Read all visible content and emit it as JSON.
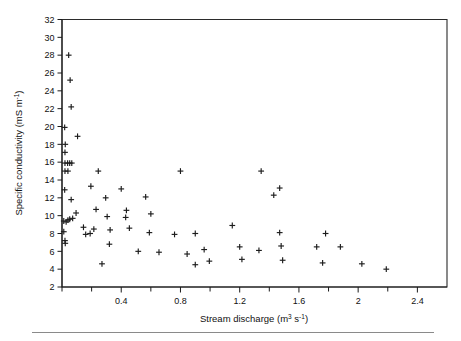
{
  "chart_data": {
    "type": "scatter",
    "title": "",
    "xlabel": "Stream discharge (m3 s-1)",
    "xlabel_parts": {
      "text_a": "Stream  discharge  (m",
      "sup_a": "3",
      "text_b": " s",
      "sup_b": "-1",
      "text_c": ")"
    },
    "ylabel": "Specific conductivity (mS m-1)",
    "ylabel_parts": {
      "text_a": "Specific conductivity (mS  m",
      "sup_a": "-1",
      "text_b": ")"
    },
    "xlim": [
      0,
      2.6
    ],
    "ylim": [
      2,
      32
    ],
    "xticks_major": [
      0.4,
      0.8,
      1.2,
      1.6,
      2,
      2.4
    ],
    "xticks_major_labels": [
      "0.4",
      "0.8",
      "1.2",
      "1.6",
      "2",
      "2.4"
    ],
    "xticks_minor": [
      0,
      0.2,
      0.6,
      1.0,
      1.4,
      1.8,
      2.2
    ],
    "yticks": [
      2,
      4,
      6,
      8,
      10,
      12,
      14,
      16,
      18,
      20,
      22,
      24,
      26,
      28,
      30,
      32
    ],
    "ytick_labels": [
      "2",
      "4",
      "6",
      "8",
      "10",
      "12",
      "14",
      "16",
      "18",
      "20",
      "22",
      "24",
      "26",
      "28",
      "30",
      "32"
    ],
    "grid": false,
    "legend": null,
    "marker": "plus",
    "marker_color": "#1c1c1c",
    "series": [
      {
        "name": "observations",
        "points": [
          [
            0.045,
            28.0
          ],
          [
            0.055,
            25.2
          ],
          [
            0.062,
            22.2
          ],
          [
            0.018,
            19.9
          ],
          [
            0.105,
            18.9
          ],
          [
            0.022,
            18.0
          ],
          [
            0.02,
            17.1
          ],
          [
            0.02,
            15.9
          ],
          [
            0.038,
            15.9
          ],
          [
            0.052,
            15.9
          ],
          [
            0.066,
            15.9
          ],
          [
            0.02,
            15.0
          ],
          [
            0.04,
            15.0
          ],
          [
            0.245,
            15.0
          ],
          [
            0.8,
            15.0
          ],
          [
            1.345,
            15.0
          ],
          [
            0.018,
            12.9
          ],
          [
            0.195,
            13.3
          ],
          [
            0.4,
            13.0
          ],
          [
            1.47,
            13.1
          ],
          [
            0.062,
            11.8
          ],
          [
            0.295,
            12.0
          ],
          [
            0.565,
            12.1
          ],
          [
            1.43,
            12.3
          ],
          [
            0.095,
            10.3
          ],
          [
            0.23,
            10.7
          ],
          [
            0.435,
            10.6
          ],
          [
            0.6,
            10.2
          ],
          [
            0.012,
            9.4
          ],
          [
            0.028,
            9.3
          ],
          [
            0.04,
            9.5
          ],
          [
            0.052,
            9.6
          ],
          [
            0.072,
            9.7
          ],
          [
            0.305,
            9.9
          ],
          [
            0.43,
            9.8
          ],
          [
            1.15,
            8.9
          ],
          [
            0.012,
            8.2
          ],
          [
            0.145,
            8.7
          ],
          [
            0.215,
            8.5
          ],
          [
            0.325,
            8.4
          ],
          [
            0.455,
            8.6
          ],
          [
            0.59,
            8.1
          ],
          [
            0.76,
            7.9
          ],
          [
            0.9,
            8.0
          ],
          [
            1.47,
            8.1
          ],
          [
            1.78,
            8.0
          ],
          [
            0.02,
            7.2
          ],
          [
            0.022,
            6.9
          ],
          [
            0.16,
            7.9
          ],
          [
            0.19,
            8.0
          ],
          [
            0.32,
            6.8
          ],
          [
            0.515,
            6.0
          ],
          [
            0.655,
            5.9
          ],
          [
            0.845,
            5.7
          ],
          [
            0.96,
            6.2
          ],
          [
            1.2,
            6.5
          ],
          [
            1.33,
            6.1
          ],
          [
            1.48,
            6.6
          ],
          [
            1.72,
            6.5
          ],
          [
            1.88,
            6.5
          ],
          [
            0.27,
            4.6
          ],
          [
            0.9,
            4.5
          ],
          [
            0.995,
            4.9
          ],
          [
            1.215,
            5.1
          ],
          [
            1.49,
            5.0
          ],
          [
            1.76,
            4.7
          ],
          [
            2.025,
            4.6
          ],
          [
            2.19,
            4.0
          ]
        ]
      }
    ]
  },
  "figure": {
    "caption_rule": true
  }
}
